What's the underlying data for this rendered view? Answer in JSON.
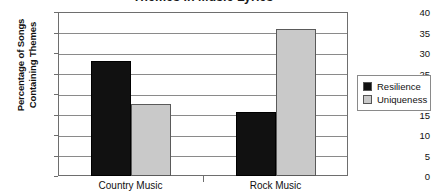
{
  "chart_data": {
    "type": "bar",
    "title": "Themes in Music Lyrics",
    "xlabel": "",
    "ylabel": "Percentage of Songs Containing Themes",
    "ylabel_lines": [
      "Percentage of Songs",
      "Containing Themes"
    ],
    "categories": [
      "Country Music",
      "Rock Music"
    ],
    "series": [
      {
        "name": "Resilience",
        "color": "#111111",
        "values": [
          28,
          15.5
        ]
      },
      {
        "name": "Uniqueness",
        "color": "#c9c9c9",
        "values": [
          17.5,
          35.8
        ]
      }
    ],
    "ylim": [
      0,
      40
    ],
    "ytick_step": 5,
    "yticks": [
      "40",
      "35",
      "30",
      "25",
      "20",
      "15",
      "10",
      "5",
      "0"
    ],
    "grid": true,
    "legend_position": "right",
    "legend_entries": [
      "Resilience",
      "Uniqueness"
    ]
  }
}
